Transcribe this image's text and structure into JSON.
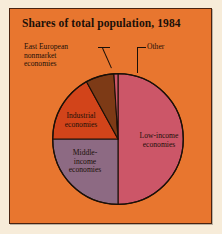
{
  "figure": {
    "title": "Shares of total population, 1984",
    "panel_color": "#e8762f",
    "background_color": "#f7ecd9",
    "border_color": "#4a2310",
    "text_color": "#1b1008"
  },
  "chart_data": {
    "type": "pie",
    "title": "Shares of total population, 1984",
    "xlabel": "",
    "ylabel": "",
    "legend": "none",
    "grid": false,
    "start_angle_deg": 0,
    "direction": "clockwise",
    "slices": [
      {
        "label": "Low-income\neconomies",
        "label_line1": "Low-income",
        "label_line2": "economies",
        "value": 50,
        "color": "#cc5668",
        "label_placement": "inside"
      },
      {
        "label": "Middle-\nincome\neconomies",
        "label_line1": "Middle-",
        "label_line2": "income",
        "label_line3": "economies",
        "value": 25,
        "color": "#8d6a83",
        "label_placement": "inside"
      },
      {
        "label": "Industrial\neconomies",
        "label_line1": "Industrial",
        "label_line2": "economies",
        "value": 17,
        "color": "#d2441a",
        "label_placement": "inside"
      },
      {
        "label": "East European\nnonmarket\neconomies",
        "label_line1": "East European",
        "label_line2": "nonmarket",
        "label_line3": "economies",
        "value": 7,
        "color": "#7d3a16",
        "label_placement": "callout"
      },
      {
        "label": "Other",
        "value": 1,
        "color": "#cc5668",
        "label_placement": "callout"
      }
    ]
  },
  "labels": {
    "east_european": "East European\nnonmarket\neconomies",
    "other": "Other",
    "industrial": "Industrial\neconomies",
    "middle_income": "Middle-\nincome\neconomies",
    "low_income": "Low-income\neconomies"
  }
}
